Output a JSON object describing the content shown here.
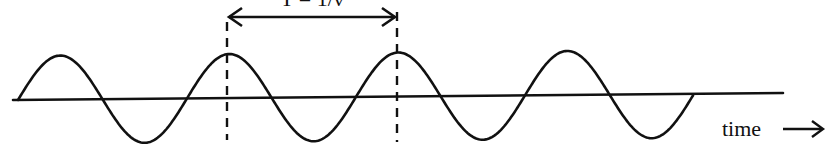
{
  "diagram": {
    "type": "periodic-wave",
    "period_label": "T = 1/ν",
    "time_axis_label": "time",
    "time_arrow_icon": "arrow-right-icon",
    "colors": {
      "ink": "#111111",
      "background": "#ffffff"
    },
    "wave": {
      "start_x": 18,
      "end_x": 693,
      "half_period_px": 84.5,
      "amplitude_px": 44,
      "cycles_shown": 4,
      "ends_after": "trough"
    },
    "period_markers": {
      "left_x": 227,
      "right_x": 397,
      "style": "dashed"
    }
  }
}
